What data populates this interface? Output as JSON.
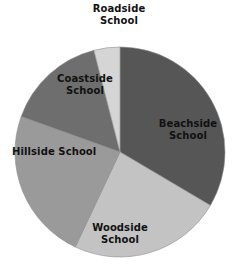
{
  "chart_data": {
    "type": "pie",
    "title": "",
    "subtitle": "",
    "xlabel": "",
    "ylabel": "",
    "legend_position": "none",
    "grid": false,
    "labels_inside": true,
    "categories": [
      "Beachside School",
      "Woodside School",
      "Hillside School",
      "Coastside School",
      "Roadside School"
    ],
    "values": [
      33.5,
      23.5,
      23.5,
      15.5,
      4.0
    ],
    "units": "percent",
    "total": 100,
    "start_angle_deg": 0,
    "direction": "clockwise",
    "slices": [
      {
        "name": "Beachside School",
        "label_line1": "Beachside",
        "label_line2": "School",
        "value": 33.5,
        "start_deg": 0,
        "end_deg": 120.6,
        "color": "#565656"
      },
      {
        "name": "Woodside School",
        "label_line1": "Woodside",
        "label_line2": "School",
        "value": 23.5,
        "start_deg": 120.6,
        "end_deg": 205.2,
        "color": "#c3c3c3"
      },
      {
        "name": "Hillside School",
        "label_line1": "Hillside School",
        "label_line2": "",
        "value": 23.5,
        "start_deg": 205.2,
        "end_deg": 289.8,
        "color": "#9a9a9a"
      },
      {
        "name": "Coastside School",
        "label_line1": "Coastside",
        "label_line2": "School",
        "value": 15.5,
        "start_deg": 289.8,
        "end_deg": 345.6,
        "color": "#6e6e6e"
      },
      {
        "name": "Roadside School",
        "label_line1": "Roadside",
        "label_line2": "School",
        "value": 4.0,
        "start_deg": 345.6,
        "end_deg": 360,
        "color": "#d5d5d5"
      }
    ],
    "geometry": {
      "center_x": 120,
      "center_y": 152,
      "radius": 105
    },
    "colors": {
      "background": "#ffffff",
      "label_text": "#111111",
      "outline": "#8f8f8f"
    }
  }
}
